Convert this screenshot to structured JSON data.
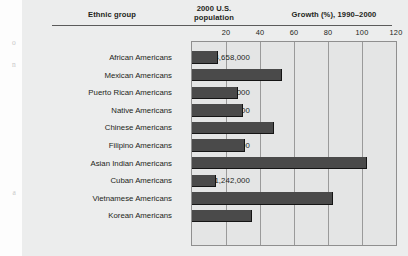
{
  "figure": {
    "headers": {
      "ethnic_group": "Ethnic group",
      "population": "2000 U.S.\npopulation",
      "population_line1": "2000 U.S.",
      "population_line2": "population",
      "growth": "Growth (%), 1990–2000"
    },
    "edge_fragments": [
      "o",
      "n",
      "a"
    ],
    "colors": {
      "bar": "#4a4a4a",
      "bar_shadow": "#141414",
      "plot_background": "#e4e5e5",
      "figure_background": "#eceded",
      "gridline": "#9a9a9a",
      "text": "#231f20"
    }
  },
  "chart_data": {
    "type": "bar",
    "orientation": "horizontal",
    "title": "Growth (%), 1990–2000",
    "xlabel": "Growth (%), 1990–2000",
    "ylabel": "Ethnic group",
    "xlim": [
      0,
      120
    ],
    "xticks": [
      20,
      40,
      60,
      80,
      100,
      120
    ],
    "xtick_labels": [
      "20",
      "40",
      "60",
      "80",
      "100",
      "120"
    ],
    "grid": true,
    "legend": "none",
    "categories": [
      "African Americans",
      "Mexican Americans",
      "Puerto Rican Americans",
      "Native Americans",
      "Chinese Americans",
      "Filipino Americans",
      "Asian Indian Americans",
      "Cuban Americans",
      "Vietnamese Americans",
      "Korean Americans"
    ],
    "population_labels": [
      "34,658,000",
      "20,641,000",
      "3,406,000",
      "2,476,000",
      "2,433,000",
      "1,850,000",
      "1,679,000",
      "1,242,000",
      "1,123,000",
      "1,077,000"
    ],
    "populations": [
      34658000,
      20641000,
      3406000,
      2476000,
      2433000,
      1850000,
      1679000,
      1242000,
      1123000,
      1077000
    ],
    "values": [
      15,
      53,
      27,
      30,
      48,
      31,
      103,
      14,
      83,
      35
    ],
    "series": [
      {
        "name": "Growth (%), 1990-2000",
        "values": [
          15,
          53,
          27,
          30,
          48,
          31,
          103,
          14,
          83,
          35
        ]
      }
    ]
  }
}
